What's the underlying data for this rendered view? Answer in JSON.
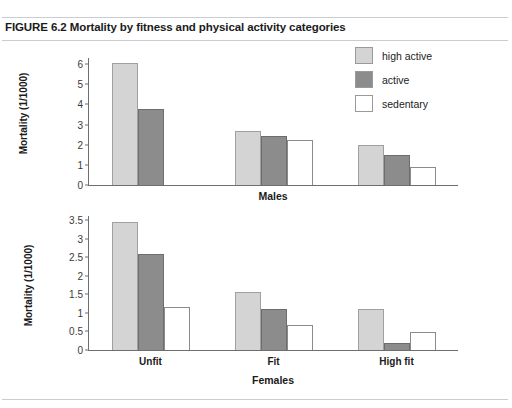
{
  "figure": {
    "title": "FIGURE 6.2 Mortality by fitness and physical activity categories"
  },
  "legend": {
    "position": "top-right",
    "items": [
      {
        "label": "high active",
        "color": "#d4d4d4",
        "swatch": "swatch-high-active"
      },
      {
        "label": "active",
        "color": "#8c8c8c",
        "swatch": "swatch-active"
      },
      {
        "label": "sedentary",
        "color": "#ffffff",
        "swatch": "swatch-sedentary"
      }
    ]
  },
  "chart_data": [
    {
      "type": "bar",
      "title": "",
      "xlabel": "Males",
      "ylabel": "Mortality (1/1000)",
      "categories": [
        "Unfit",
        "Fit",
        "High fit"
      ],
      "xtick_labels": [
        "",
        "",
        ""
      ],
      "ytick_labels": [
        "0",
        "1",
        "2",
        "3",
        "4",
        "5",
        "6"
      ],
      "yticks": [
        0,
        1,
        2,
        3,
        4,
        5,
        6
      ],
      "ylim": [
        0,
        6.3
      ],
      "grid": false,
      "series": [
        {
          "name": "high active",
          "color": "#d4d4d4",
          "values": [
            6.05,
            2.7,
            2.0
          ]
        },
        {
          "name": "active",
          "color": "#8c8c8c",
          "values": [
            3.75,
            2.45,
            1.5
          ]
        },
        {
          "name": "sedentary",
          "color": "#ffffff",
          "values": [
            null,
            2.25,
            0.9
          ]
        }
      ]
    },
    {
      "type": "bar",
      "title": "",
      "xlabel": "Females",
      "ylabel": "Mortality (1/1000)",
      "categories": [
        "Unfit",
        "Fit",
        "High fit"
      ],
      "xtick_labels": [
        "Unfit",
        "Fit",
        "High fit"
      ],
      "ytick_labels": [
        "0",
        "0.5",
        "1",
        "1.5",
        "2",
        "2.5",
        "3",
        "3.5"
      ],
      "yticks": [
        0,
        0.5,
        1,
        1.5,
        2,
        2.5,
        3,
        3.5
      ],
      "ylim": [
        0,
        3.62
      ],
      "grid": false,
      "series": [
        {
          "name": "high active",
          "color": "#d4d4d4",
          "values": [
            3.45,
            1.57,
            1.1
          ]
        },
        {
          "name": "active",
          "color": "#8c8c8c",
          "values": [
            2.6,
            1.1,
            0.2
          ]
        },
        {
          "name": "sedentary",
          "color": "#ffffff",
          "values": [
            1.15,
            0.67,
            0.5
          ]
        }
      ]
    }
  ]
}
